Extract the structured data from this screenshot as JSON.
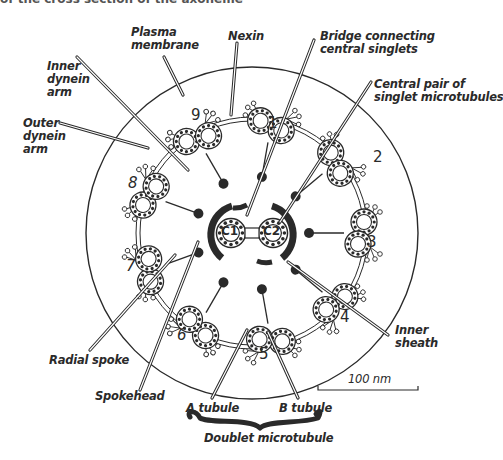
{
  "caption_fragment": "of the cross section of the axoneme",
  "colors": {
    "ink": "#2a2a2a",
    "background": "#ffffff"
  },
  "labels": {
    "plasma_membrane": "Plasma\nmembrane",
    "nexin": "Nexin",
    "bridge": "Bridge connecting\ncentral singlets",
    "central_pair": "Central pair of\nsinglet microtubules",
    "inner_dynein_arm": "Inner\ndynein\narm",
    "outer_dynein_arm": "Outer\ndynein\narm",
    "radial_spoke": "Radial spoke",
    "spokehead": "Spokehead",
    "inner_sheath": "Inner\nsheath",
    "a_tubule": "A tubule",
    "b_tubule": "B tubule",
    "doublet_microtubule": "Doublet microtubule",
    "scale_bar": "100 nm"
  },
  "central_singlets": [
    "C1",
    "C2"
  ],
  "doublet_numbers": [
    "1",
    "2",
    "3",
    "4",
    "5",
    "6",
    "7",
    "8",
    "9"
  ]
}
